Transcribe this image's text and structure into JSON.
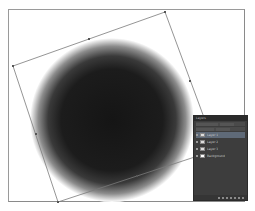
{
  "canvas": {
    "background": "#ffffff",
    "frame_color": "#9a9a9a"
  },
  "artwork": {
    "shape": "radial-gradient-circle",
    "center": [
      112,
      120
    ],
    "radius": 80,
    "inner_color": "#1a1a1a",
    "outer_color": "#ffffff"
  },
  "transform_box": {
    "corners": [
      [
        13,
        66
      ],
      [
        165,
        12
      ],
      [
        216,
        150
      ],
      [
        58,
        202
      ]
    ],
    "handles": [
      [
        89,
        39
      ],
      [
        36,
        134
      ],
      [
        190,
        81
      ],
      [
        137,
        176
      ]
    ],
    "stroke_color": "#7a7a7a"
  },
  "layers_panel": {
    "tab_label": "Layers",
    "background": "#3d3d3d",
    "layers": [
      {
        "name": "Layer 1",
        "selected": true,
        "thumb": "gray"
      },
      {
        "name": "Layer 2",
        "selected": false,
        "thumb": "gray"
      },
      {
        "name": "Layer 3",
        "selected": false,
        "thumb": "gray"
      },
      {
        "name": "Background",
        "selected": false,
        "thumb": "white"
      }
    ]
  }
}
